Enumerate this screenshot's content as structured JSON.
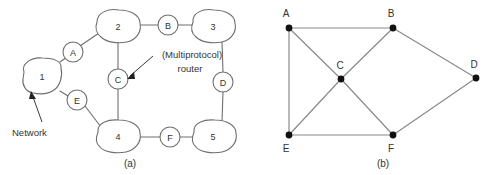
{
  "figure": {
    "panels": [
      {
        "id": "panel-a",
        "caption": "(a)",
        "type": "network-cloud-diagram",
        "networks": [
          {
            "id": "net-1",
            "label": "1",
            "cx": 42,
            "cy": 77
          },
          {
            "id": "net-2",
            "label": "2",
            "cx": 118,
            "cy": 27
          },
          {
            "id": "net-3",
            "label": "3",
            "cx": 213,
            "cy": 27
          },
          {
            "id": "net-4",
            "label": "4",
            "cx": 118,
            "cy": 137
          },
          {
            "id": "net-5",
            "label": "5",
            "cx": 213,
            "cy": 137
          }
        ],
        "routers": [
          {
            "id": "router-a",
            "label": "A",
            "cx": 73,
            "cy": 52
          },
          {
            "id": "router-b",
            "label": "B",
            "cx": 168,
            "cy": 25
          },
          {
            "id": "router-c",
            "label": "C",
            "cx": 118,
            "cy": 79
          },
          {
            "id": "router-d",
            "label": "D",
            "cx": 223,
            "cy": 82
          },
          {
            "id": "router-e",
            "label": "E",
            "cx": 77,
            "cy": 100
          },
          {
            "id": "router-f",
            "label": "F",
            "cx": 170,
            "cy": 137
          }
        ],
        "links": [
          {
            "from": "net-1",
            "to": "router-a"
          },
          {
            "from": "router-a",
            "to": "net-2"
          },
          {
            "from": "net-2",
            "to": "router-b"
          },
          {
            "from": "router-b",
            "to": "net-3"
          },
          {
            "from": "net-2",
            "to": "router-c"
          },
          {
            "from": "router-c",
            "to": "net-4"
          },
          {
            "from": "net-3",
            "to": "router-d"
          },
          {
            "from": "router-d",
            "to": "net-5"
          },
          {
            "from": "net-1",
            "to": "router-e"
          },
          {
            "from": "router-e",
            "to": "net-4"
          },
          {
            "from": "net-4",
            "to": "router-f"
          },
          {
            "from": "router-f",
            "to": "net-5"
          }
        ],
        "annotations": [
          {
            "id": "annot-network",
            "text": "Network",
            "text_x": 36,
            "text_y": 132,
            "target": "net-1",
            "anchor": "start"
          },
          {
            "id": "annot-router",
            "line1": "(Multiprotocol)",
            "line2": "router",
            "text_x": 192,
            "text_y": 62,
            "target": "router-c",
            "anchor": "middle"
          }
        ]
      },
      {
        "id": "panel-b",
        "caption": "(b)",
        "type": "graph-diagram",
        "vertices": [
          {
            "id": "v-a",
            "label": "A",
            "x": 289,
            "y": 28,
            "label_x": 286,
            "label_y": 17
          },
          {
            "id": "v-b",
            "label": "B",
            "x": 393,
            "y": 28,
            "label_x": 391,
            "label_y": 17
          },
          {
            "id": "v-c",
            "label": "C",
            "x": 341,
            "y": 79,
            "label_x": 340,
            "label_y": 69
          },
          {
            "id": "v-d",
            "label": "D",
            "x": 476,
            "y": 78,
            "label_x": 474,
            "label_y": 68
          },
          {
            "id": "v-e",
            "label": "E",
            "x": 289,
            "y": 135,
            "label_x": 286,
            "label_y": 152
          },
          {
            "id": "v-f",
            "label": "F",
            "x": 393,
            "y": 135,
            "label_x": 391,
            "label_y": 152
          }
        ],
        "edges": [
          {
            "from": "v-a",
            "to": "v-b"
          },
          {
            "from": "v-a",
            "to": "v-e"
          },
          {
            "from": "v-a",
            "to": "v-c"
          },
          {
            "from": "v-c",
            "to": "v-b"
          },
          {
            "from": "v-c",
            "to": "v-e"
          },
          {
            "from": "v-c",
            "to": "v-f"
          },
          {
            "from": "v-b",
            "to": "v-d"
          },
          {
            "from": "v-f",
            "to": "v-d"
          },
          {
            "from": "v-e",
            "to": "v-f"
          }
        ]
      }
    ],
    "captions": [
      {
        "id": "caption-a",
        "text": "(a)",
        "x": 130,
        "y": 164
      },
      {
        "id": "caption-b",
        "text": "(b)",
        "x": 383,
        "y": 164
      }
    ],
    "colors": {
      "line": "#6f6f6f",
      "line_b": "#8a8a8a",
      "text": "#333333",
      "dot": "#111111",
      "background": "#ffffff"
    }
  }
}
